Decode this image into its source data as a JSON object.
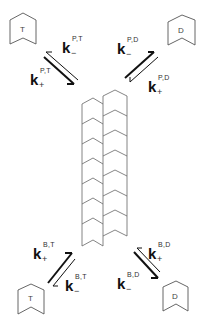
{
  "diagram": {
    "type": "microtubule-end-kinetics",
    "subunits": {
      "top_left": {
        "letter": "T"
      },
      "top_right": {
        "letter": "D"
      },
      "bottom_left": {
        "letter": "T"
      },
      "bottom_right": {
        "letter": "D"
      }
    },
    "rate_constants": {
      "p_t_minus": {
        "symbol": "k",
        "sign": "−",
        "superscript": "P,T"
      },
      "p_t_plus": {
        "symbol": "k",
        "sign": "+",
        "superscript": "P,T"
      },
      "p_d_minus": {
        "symbol": "k",
        "sign": "−",
        "superscript": "P,D"
      },
      "p_d_plus": {
        "symbol": "k",
        "sign": "+",
        "superscript": "P,D"
      },
      "b_t_plus": {
        "symbol": "k",
        "sign": "+",
        "superscript": "B,T"
      },
      "b_t_minus": {
        "symbol": "k",
        "sign": "−",
        "superscript": "B,T"
      },
      "b_d_plus": {
        "symbol": "k",
        "sign": "+",
        "superscript": "B,D"
      },
      "b_d_minus": {
        "symbol": "k",
        "sign": "−",
        "superscript": "B,D"
      }
    },
    "polymer": {
      "protofilaments": 2,
      "left_units": 7,
      "right_units": 7
    },
    "colors": {
      "line": "#555555",
      "arrow": "#111111",
      "text": "#111111"
    }
  }
}
